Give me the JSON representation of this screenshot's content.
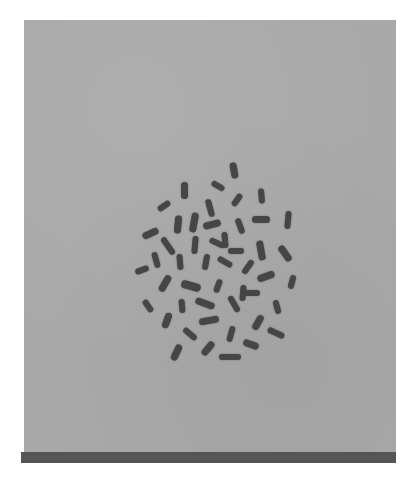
{
  "image": {
    "subject": "metaphase chromosome spread (microscopy)",
    "background_color": "#a9a9a9",
    "chromosome_color": "#464646",
    "bar_color": "#555555"
  },
  "chromosomes": [
    {
      "x": 234,
      "y": 170,
      "len": 16,
      "w": 7,
      "angle": 80
    },
    {
      "x": 184,
      "y": 190,
      "len": 17,
      "w": 7,
      "angle": 90
    },
    {
      "x": 218,
      "y": 186,
      "len": 14,
      "w": 6,
      "angle": 30
    },
    {
      "x": 237,
      "y": 200,
      "len": 14,
      "w": 6,
      "angle": -55
    },
    {
      "x": 261,
      "y": 196,
      "len": 15,
      "w": 6,
      "angle": 85
    },
    {
      "x": 164,
      "y": 206,
      "len": 14,
      "w": 6,
      "angle": -35
    },
    {
      "x": 210,
      "y": 208,
      "len": 18,
      "w": 6,
      "angle": 75
    },
    {
      "x": 194,
      "y": 222,
      "len": 20,
      "w": 7,
      "angle": 100
    },
    {
      "x": 178,
      "y": 224,
      "len": 18,
      "w": 7,
      "angle": 95
    },
    {
      "x": 212,
      "y": 224,
      "len": 18,
      "w": 7,
      "angle": -15
    },
    {
      "x": 240,
      "y": 226,
      "len": 16,
      "w": 6,
      "angle": 70
    },
    {
      "x": 261,
      "y": 219,
      "len": 18,
      "w": 7,
      "angle": 0
    },
    {
      "x": 288,
      "y": 220,
      "len": 18,
      "w": 6,
      "angle": 95
    },
    {
      "x": 150,
      "y": 233,
      "len": 17,
      "w": 7,
      "angle": -25
    },
    {
      "x": 168,
      "y": 246,
      "len": 20,
      "w": 6,
      "angle": 55
    },
    {
      "x": 195,
      "y": 245,
      "len": 18,
      "w": 6,
      "angle": 95
    },
    {
      "x": 217,
      "y": 243,
      "len": 16,
      "w": 6,
      "angle": 25
    },
    {
      "x": 225,
      "y": 240,
      "len": 16,
      "w": 6,
      "angle": 85
    },
    {
      "x": 236,
      "y": 251,
      "len": 16,
      "w": 6,
      "angle": 0
    },
    {
      "x": 261,
      "y": 250,
      "len": 20,
      "w": 7,
      "angle": 80
    },
    {
      "x": 285,
      "y": 253,
      "len": 18,
      "w": 7,
      "angle": 55
    },
    {
      "x": 156,
      "y": 260,
      "len": 16,
      "w": 6,
      "angle": 75
    },
    {
      "x": 142,
      "y": 270,
      "len": 14,
      "w": 6,
      "angle": -20
    },
    {
      "x": 180,
      "y": 262,
      "len": 16,
      "w": 6,
      "angle": 85
    },
    {
      "x": 206,
      "y": 262,
      "len": 16,
      "w": 6,
      "angle": 100
    },
    {
      "x": 225,
      "y": 262,
      "len": 16,
      "w": 6,
      "angle": 30
    },
    {
      "x": 248,
      "y": 267,
      "len": 16,
      "w": 6,
      "angle": -55
    },
    {
      "x": 266,
      "y": 276,
      "len": 18,
      "w": 7,
      "angle": -20
    },
    {
      "x": 292,
      "y": 282,
      "len": 14,
      "w": 6,
      "angle": -75
    },
    {
      "x": 165,
      "y": 283,
      "len": 18,
      "w": 7,
      "angle": -60
    },
    {
      "x": 191,
      "y": 286,
      "len": 20,
      "w": 8,
      "angle": 15
    },
    {
      "x": 218,
      "y": 286,
      "len": 14,
      "w": 6,
      "angle": -70
    },
    {
      "x": 243,
      "y": 293,
      "len": 16,
      "w": 6,
      "angle": 95
    },
    {
      "x": 252,
      "y": 293,
      "len": 16,
      "w": 6,
      "angle": 0
    },
    {
      "x": 277,
      "y": 307,
      "len": 14,
      "w": 6,
      "angle": 75
    },
    {
      "x": 148,
      "y": 306,
      "len": 14,
      "w": 6,
      "angle": 55
    },
    {
      "x": 182,
      "y": 306,
      "len": 14,
      "w": 6,
      "angle": 85
    },
    {
      "x": 205,
      "y": 303,
      "len": 20,
      "w": 7,
      "angle": 20
    },
    {
      "x": 234,
      "y": 304,
      "len": 18,
      "w": 6,
      "angle": 60
    },
    {
      "x": 258,
      "y": 322,
      "len": 16,
      "w": 7,
      "angle": -60
    },
    {
      "x": 167,
      "y": 320,
      "len": 16,
      "w": 7,
      "angle": -70
    },
    {
      "x": 209,
      "y": 320,
      "len": 20,
      "w": 7,
      "angle": -10
    },
    {
      "x": 231,
      "y": 334,
      "len": 16,
      "w": 6,
      "angle": -75
    },
    {
      "x": 276,
      "y": 333,
      "len": 18,
      "w": 6,
      "angle": 25
    },
    {
      "x": 190,
      "y": 334,
      "len": 16,
      "w": 6,
      "angle": 40
    },
    {
      "x": 251,
      "y": 344,
      "len": 16,
      "w": 7,
      "angle": 20
    },
    {
      "x": 176,
      "y": 352,
      "len": 17,
      "w": 7,
      "angle": -65
    },
    {
      "x": 208,
      "y": 348,
      "len": 16,
      "w": 7,
      "angle": -50
    },
    {
      "x": 230,
      "y": 357,
      "len": 22,
      "w": 6,
      "angle": 0
    }
  ]
}
